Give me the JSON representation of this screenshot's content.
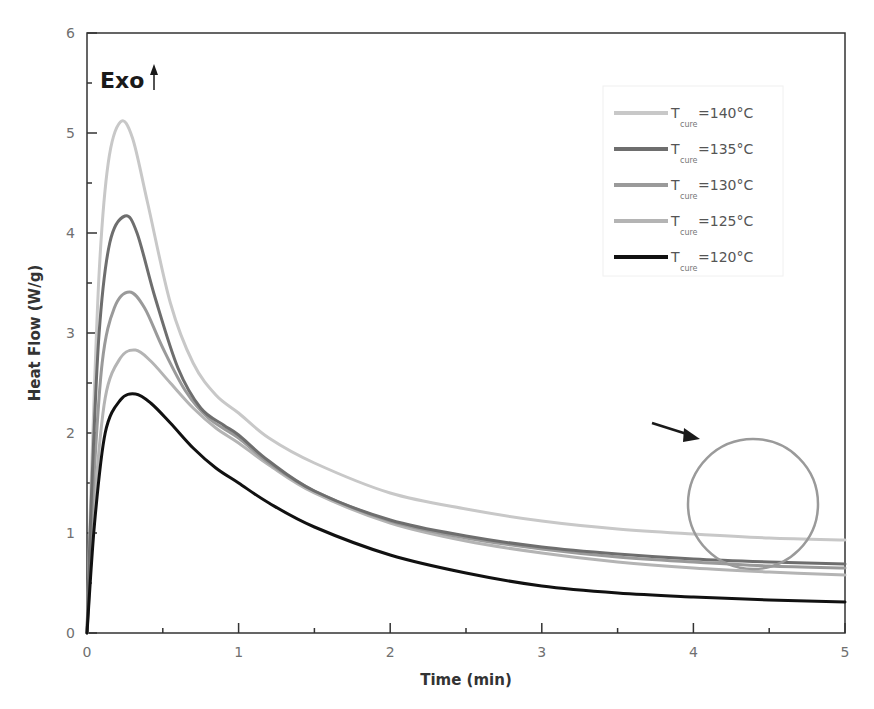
{
  "chart_data": {
    "type": "line",
    "title": "",
    "xlabel": "Time (min)",
    "ylabel": "Heat Flow (W/g)",
    "xlim": [
      0,
      5
    ],
    "ylim": [
      0,
      6
    ],
    "x_ticks": [
      "0",
      "1",
      "2",
      "3",
      "4",
      "5"
    ],
    "y_ticks": [
      "0",
      "1",
      "2",
      "3",
      "4",
      "5",
      "6"
    ],
    "grid": false,
    "legend_position": "upper right",
    "annotations": {
      "exo_label": "Exo",
      "exo_arrow": "up",
      "circle": {
        "center_x_min": 4.4,
        "center_y_wg": 1.29,
        "note": "highlighted tail region"
      },
      "arrow": {
        "from": [
          3.72,
          2.08
        ],
        "to": [
          4.02,
          1.94
        ]
      }
    },
    "series": [
      {
        "name": "T_cure=140°C",
        "label_main": "T",
        "label_sub": "cure",
        "label_value": "=140°C",
        "color": "#c8c8c8",
        "width": 3,
        "points": [
          [
            0,
            0
          ],
          [
            0.03,
            1.6
          ],
          [
            0.08,
            3.6
          ],
          [
            0.14,
            4.7
          ],
          [
            0.22,
            5.11
          ],
          [
            0.3,
            4.95
          ],
          [
            0.4,
            4.3
          ],
          [
            0.55,
            3.3
          ],
          [
            0.7,
            2.7
          ],
          [
            0.85,
            2.38
          ],
          [
            1.0,
            2.2
          ],
          [
            1.2,
            1.95
          ],
          [
            1.5,
            1.7
          ],
          [
            2.0,
            1.4
          ],
          [
            2.5,
            1.24
          ],
          [
            3.0,
            1.12
          ],
          [
            3.5,
            1.04
          ],
          [
            4.0,
            0.99
          ],
          [
            4.5,
            0.95
          ],
          [
            5.0,
            0.93
          ]
        ]
      },
      {
        "name": "T_cure=135°C",
        "label_main": "T",
        "label_sub": "cure",
        "label_value": "=135°C",
        "color": "#6e6e6e",
        "width": 3,
        "points": [
          [
            0,
            0
          ],
          [
            0.03,
            1.4
          ],
          [
            0.08,
            3.0
          ],
          [
            0.15,
            3.9
          ],
          [
            0.25,
            4.17
          ],
          [
            0.33,
            4.0
          ],
          [
            0.45,
            3.35
          ],
          [
            0.6,
            2.65
          ],
          [
            0.75,
            2.25
          ],
          [
            0.9,
            2.08
          ],
          [
            1.0,
            1.98
          ],
          [
            1.2,
            1.72
          ],
          [
            1.5,
            1.42
          ],
          [
            2.0,
            1.13
          ],
          [
            2.5,
            0.97
          ],
          [
            3.0,
            0.86
          ],
          [
            3.5,
            0.79
          ],
          [
            4.0,
            0.74
          ],
          [
            4.5,
            0.71
          ],
          [
            5.0,
            0.69
          ]
        ]
      },
      {
        "name": "T_cure=130°C",
        "label_main": "T",
        "label_sub": "cure",
        "label_value": "=130°C",
        "color": "#9a9a9a",
        "width": 3,
        "points": [
          [
            0,
            0
          ],
          [
            0.04,
            1.4
          ],
          [
            0.1,
            2.7
          ],
          [
            0.18,
            3.25
          ],
          [
            0.28,
            3.41
          ],
          [
            0.38,
            3.25
          ],
          [
            0.5,
            2.85
          ],
          [
            0.65,
            2.42
          ],
          [
            0.8,
            2.15
          ],
          [
            1.0,
            1.95
          ],
          [
            1.2,
            1.7
          ],
          [
            1.5,
            1.42
          ],
          [
            2.0,
            1.12
          ],
          [
            2.5,
            0.95
          ],
          [
            3.0,
            0.84
          ],
          [
            3.5,
            0.76
          ],
          [
            4.0,
            0.71
          ],
          [
            4.5,
            0.67
          ],
          [
            5.0,
            0.65
          ]
        ]
      },
      {
        "name": "T_cure=125°C",
        "label_main": "T",
        "label_sub": "cure",
        "label_value": "=125°C",
        "color": "#b4b4b4",
        "width": 3,
        "points": [
          [
            0,
            0
          ],
          [
            0.05,
            1.3
          ],
          [
            0.12,
            2.35
          ],
          [
            0.22,
            2.75
          ],
          [
            0.32,
            2.83
          ],
          [
            0.42,
            2.72
          ],
          [
            0.55,
            2.5
          ],
          [
            0.7,
            2.25
          ],
          [
            0.85,
            2.05
          ],
          [
            1.0,
            1.9
          ],
          [
            1.2,
            1.68
          ],
          [
            1.5,
            1.4
          ],
          [
            2.0,
            1.1
          ],
          [
            2.5,
            0.92
          ],
          [
            3.0,
            0.8
          ],
          [
            3.5,
            0.71
          ],
          [
            4.0,
            0.65
          ],
          [
            4.5,
            0.61
          ],
          [
            5.0,
            0.58
          ]
        ]
      },
      {
        "name": "T_cure=120°C",
        "label_main": "T",
        "label_sub": "cure",
        "label_value": "=120°C",
        "color": "#111111",
        "width": 3,
        "points": [
          [
            0,
            0
          ],
          [
            0.05,
            1.1
          ],
          [
            0.12,
            2.0
          ],
          [
            0.22,
            2.33
          ],
          [
            0.32,
            2.39
          ],
          [
            0.42,
            2.3
          ],
          [
            0.55,
            2.1
          ],
          [
            0.7,
            1.85
          ],
          [
            0.85,
            1.65
          ],
          [
            1.0,
            1.5
          ],
          [
            1.2,
            1.3
          ],
          [
            1.5,
            1.06
          ],
          [
            2.0,
            0.78
          ],
          [
            2.5,
            0.6
          ],
          [
            3.0,
            0.47
          ],
          [
            3.5,
            0.4
          ],
          [
            4.0,
            0.36
          ],
          [
            4.5,
            0.33
          ],
          [
            5.0,
            0.31
          ]
        ]
      }
    ]
  }
}
